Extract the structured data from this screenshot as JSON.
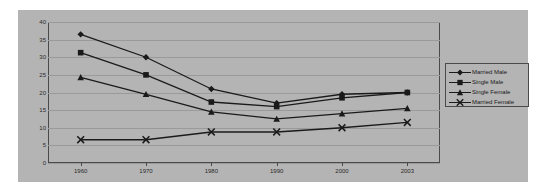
{
  "chart_data": {
    "type": "line",
    "title": "",
    "subtitle": "",
    "xlabel": "",
    "ylabel": "",
    "categories": [
      "1960",
      "1970",
      "1980",
      "1990",
      "2000",
      "2003"
    ],
    "x": [
      1960,
      1970,
      1980,
      1990,
      2000,
      2003
    ],
    "ylim": [
      0,
      40
    ],
    "yticks": [
      0,
      5,
      10,
      15,
      20,
      25,
      30,
      35,
      40
    ],
    "ytick_labels": [
      "0",
      "5",
      "10",
      "15",
      "20",
      "25",
      "30",
      "35",
      "40"
    ],
    "grid": true,
    "legend_position": "right",
    "series": [
      {
        "name": "Married Male",
        "marker": "diamond",
        "color": "#1a1a1a",
        "values": [
          36.5,
          30.0,
          21.0,
          17.0,
          19.5,
          20.0
        ]
      },
      {
        "name": "Single Male",
        "marker": "square",
        "color": "#1a1a1a",
        "values": [
          31.3,
          25.0,
          17.3,
          16.0,
          18.5,
          20.0
        ]
      },
      {
        "name": "Single Female",
        "marker": "triangle",
        "color": "#1a1a1a",
        "values": [
          24.3,
          19.5,
          14.5,
          12.5,
          14.0,
          15.5
        ]
      },
      {
        "name": "Married Female",
        "marker": "x",
        "color": "#1a1a1a",
        "values": [
          6.6,
          6.6,
          8.8,
          8.8,
          10.0,
          11.5
        ]
      }
    ]
  },
  "legend": {
    "items": [
      {
        "label": "Married Male",
        "marker": "diamond"
      },
      {
        "label": "Single Male",
        "marker": "square"
      },
      {
        "label": "Single Female",
        "marker": "triangle"
      },
      {
        "label": "Married Female",
        "marker": "x"
      }
    ]
  },
  "axes": {
    "y_tick_labels": [
      "40",
      "35",
      "30",
      "25",
      "20",
      "15",
      "10",
      "5",
      "0"
    ],
    "x_tick_labels": [
      "1960",
      "1970",
      "1980",
      "1990",
      "2000",
      "2003"
    ]
  },
  "colors": {
    "plot_background": "#b4b4b4",
    "page_background": "#ffffff",
    "series_color": "#1a1a1a",
    "grid_color": "#9a9a9a",
    "frame_color": "#4a4a4a"
  }
}
